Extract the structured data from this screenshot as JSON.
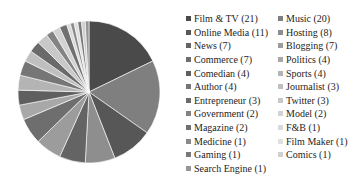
{
  "chart_data": {
    "type": "pie",
    "title": "",
    "subtitle": "",
    "xlabel": "",
    "ylabel": "",
    "total": 100,
    "start_angle_deg": 0,
    "direction": "clockwise",
    "legend_position": "right",
    "grid": false,
    "categories": [
      "Film & TV",
      "Music",
      "Online Media",
      "Hosting",
      "News",
      "Blogging",
      "Commerce",
      "Politics",
      "Comedian",
      "Sports",
      "Author",
      "Journalist",
      "Entrepreneur",
      "Twitter",
      "Government",
      "Model",
      "Magazine",
      "F&B",
      "Medicine",
      "Film Maker",
      "Gaming",
      "Comics",
      "Search Engine"
    ],
    "values": [
      21,
      20,
      11,
      8,
      7,
      7,
      7,
      4,
      4,
      4,
      4,
      3,
      3,
      3,
      2,
      2,
      2,
      1,
      1,
      1,
      1,
      1,
      1
    ],
    "colors": [
      "#4a4a4a",
      "#7f7f7f",
      "#575757",
      "#8e8e8e",
      "#646464",
      "#9c9c9c",
      "#6e6e6e",
      "#a8a8a8",
      "#5f5f5f",
      "#b4b4b4",
      "#767676",
      "#bfbfbf",
      "#6a6a6a",
      "#c8c8c8",
      "#838383",
      "#d2d2d2",
      "#707070",
      "#dadada",
      "#8a8a8a",
      "#e0e0e0",
      "#797979",
      "#cfcfcf",
      "#959595"
    ]
  },
  "legend": {
    "columns": [
      {
        "entries": [
          {
            "label": "Film & TV (21)",
            "color": "#4a4a4a"
          },
          {
            "label": "Online Media (11)",
            "color": "#575757"
          },
          {
            "label": "News (7)",
            "color": "#646464"
          },
          {
            "label": "Commerce (7)",
            "color": "#6e6e6e"
          },
          {
            "label": "Comedian (4)",
            "color": "#5f5f5f"
          },
          {
            "label": "Author (4)",
            "color": "#767676"
          },
          {
            "label": "Entrepreneur (3)",
            "color": "#6a6a6a"
          },
          {
            "label": "Government (2)",
            "color": "#838383"
          },
          {
            "label": "Magazine (2)",
            "color": "#707070"
          },
          {
            "label": "Medicine (1)",
            "color": "#8a8a8a"
          },
          {
            "label": "Gaming (1)",
            "color": "#797979"
          },
          {
            "label": "Search Engine (1)",
            "color": "#959595"
          }
        ]
      },
      {
        "entries": [
          {
            "label": "Music (20)",
            "color": "#7f7f7f"
          },
          {
            "label": "Hosting (8)",
            "color": "#8e8e8e"
          },
          {
            "label": "Blogging (7)",
            "color": "#9c9c9c"
          },
          {
            "label": "Politics (4)",
            "color": "#a8a8a8"
          },
          {
            "label": "Sports (4)",
            "color": "#b4b4b4"
          },
          {
            "label": "Journalist (3)",
            "color": "#bfbfbf"
          },
          {
            "label": "Twitter (3)",
            "color": "#c8c8c8"
          },
          {
            "label": "Model (2)",
            "color": "#d2d2d2"
          },
          {
            "label": "F&B (1)",
            "color": "#dadada"
          },
          {
            "label": "Film Maker (1)",
            "color": "#e0e0e0"
          },
          {
            "label": "Comics (1)",
            "color": "#cfcfcf"
          }
        ]
      }
    ]
  }
}
